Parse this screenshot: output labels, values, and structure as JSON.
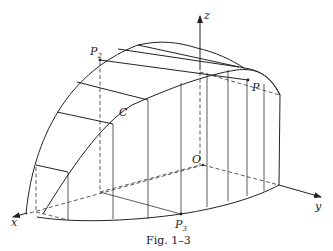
{
  "figure": {
    "caption": "Fig. 1–3",
    "axes": {
      "x_label": "x",
      "y_label": "y",
      "z_label": "z",
      "origin_label": "O"
    },
    "points": {
      "P": "P",
      "P2_main": "P",
      "P2_sub": "2",
      "P3_main": "P",
      "P3_sub": "3",
      "C": "C"
    }
  }
}
